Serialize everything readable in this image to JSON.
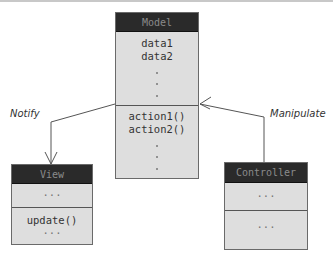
{
  "diagram": {
    "model": {
      "title": "Model",
      "attributes": [
        "data1",
        "data2"
      ],
      "methods": [
        "action1()",
        "action2()"
      ],
      "ellipsis_dots": "⋮"
    },
    "view": {
      "title": "View",
      "attributes_placeholder": "...",
      "methods": [
        "update()"
      ],
      "methods_placeholder": "..."
    },
    "controller": {
      "title": "Controller",
      "attributes_placeholder": "...",
      "methods_placeholder": "..."
    },
    "edges": [
      {
        "from": "Model",
        "to": "View",
        "label": "Notify"
      },
      {
        "from": "Controller",
        "to": "Model",
        "label": "Manipulate"
      }
    ],
    "colors": {
      "header_bg": "#2a2a2a",
      "header_text": "#8a8a8a",
      "body_bg": "#dedede",
      "border": "#6a6a6a",
      "edge": "#555555"
    }
  }
}
